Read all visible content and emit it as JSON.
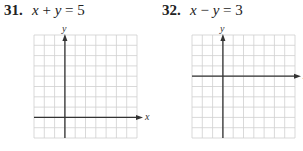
{
  "problems": [
    {
      "number": "31.",
      "equation": {
        "lhs_var1": "x",
        "op": "+",
        "lhs_var2": "y",
        "eq": "=",
        "rhs": "5"
      },
      "graph": {
        "x_label": "x",
        "y_label": "y",
        "columns": 10,
        "rows": 10,
        "y_axis_col": 3,
        "x_axis_row": 8
      }
    },
    {
      "number": "32.",
      "equation": {
        "lhs_var1": "x",
        "op": "−",
        "lhs_var2": "y",
        "eq": "=",
        "rhs": "3"
      },
      "graph": {
        "x_label": "x",
        "y_label": "y",
        "columns": 10,
        "rows": 10,
        "y_axis_col": 3,
        "x_axis_row": 4
      }
    }
  ],
  "colors": {
    "grid": "#cfcfcf",
    "axis": "#333333",
    "text": "#222222"
  }
}
